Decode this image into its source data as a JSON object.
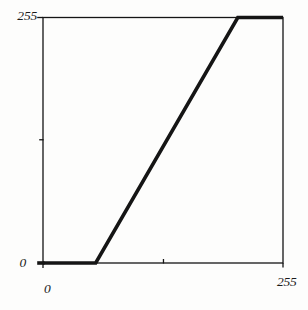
{
  "figure": {
    "background": "#fdfdfc",
    "line_color": "#151515"
  },
  "axis_labels": {
    "y_max": "255",
    "y_min": "0",
    "x_min": "0",
    "x_max": "255"
  },
  "chart_data": {
    "type": "line",
    "title": "",
    "xlabel": "",
    "ylabel": "",
    "xlim": [
      0,
      255
    ],
    "ylim": [
      0,
      255
    ],
    "grid": false,
    "legend": false,
    "x_tick_labels": [
      "0",
      "255"
    ],
    "y_tick_labels": [
      "0",
      "255"
    ],
    "ticks": {
      "x": [
        0,
        128,
        255
      ],
      "y": [
        0,
        128,
        255
      ]
    },
    "series": [
      {
        "name": "piecewise-linear-intensity-transform",
        "points": [
          [
            0,
            0
          ],
          [
            56,
            0
          ],
          [
            207,
            255
          ],
          [
            255,
            255
          ]
        ]
      }
    ]
  }
}
